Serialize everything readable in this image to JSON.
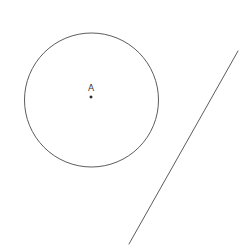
{
  "figure": {
    "canvas": {
      "width": 248,
      "height": 249,
      "background_color": "#ffffff"
    },
    "stroke_color": "#4a4a4a",
    "label_color": "#3a3a3a",
    "point_color": "#1a1a1a",
    "shapes": {
      "circle": {
        "name": "circle-A",
        "center_x": 91.5,
        "center_y": 100,
        "radius": 67,
        "stroke_width": 0.9,
        "fill": "none"
      },
      "center_point": {
        "name": "point-A",
        "x": 91,
        "y": 97,
        "size": 2.2
      },
      "center_label": {
        "name": "label-A",
        "text": "A",
        "x": 91,
        "y": 91
      },
      "line_segment": {
        "name": "line-segment",
        "x1": 238,
        "y1": 51,
        "x2": 129,
        "y2": 244,
        "stroke_width": 0.9
      }
    }
  }
}
